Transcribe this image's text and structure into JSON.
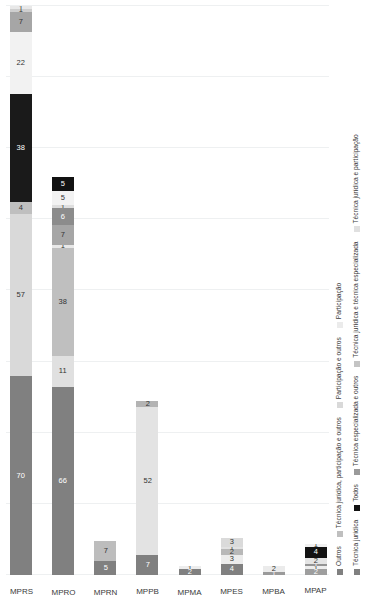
{
  "chart_data": {
    "type": "bar",
    "orientation": "stacked-horizontal",
    "title": "",
    "xlabel": "",
    "ylabel": "",
    "grid": true,
    "legend_position": "bottom",
    "xlim": [
      0,
      200
    ],
    "categories": [
      "MPRS",
      "MPRO",
      "MPRN",
      "MPPB",
      "MPMA",
      "MPES",
      "MPBA",
      "MPAP"
    ],
    "series": [
      {
        "name": "Técnica jurídica",
        "color": "#808080",
        "values": [
          70,
          66,
          5,
          7,
          2,
          4,
          1,
          2
        ]
      },
      {
        "name": "Todos",
        "color": "#121212",
        "values": [
          0,
          0,
          0,
          0,
          0,
          0,
          0,
          4
        ]
      },
      {
        "name": "Técnica especializada e outros",
        "color": "#d9d9d9",
        "values": [
          57,
          11,
          7,
          52,
          0,
          3,
          2,
          1
        ]
      },
      {
        "name": "Técnica jurídica e técnica especializada",
        "color": "#bfbfbf",
        "values": [
          4,
          38,
          0,
          0,
          1,
          2,
          0,
          2
        ]
      },
      {
        "name": "Técnica jurídica e participação",
        "color": "#e8e8e8",
        "values": [
          0,
          1,
          0,
          0,
          0,
          1,
          0,
          1
        ]
      },
      {
        "name": "Outros",
        "color": "#1a1a1a",
        "values": [
          38,
          7,
          0,
          0,
          0,
          0,
          0,
          0
        ]
      },
      {
        "name": "Técnica jurídica, participação e outros",
        "color": "#f2f2f2",
        "values": [
          22,
          6,
          0,
          2,
          1,
          3,
          0,
          1
        ]
      },
      {
        "name": "Participação e outros",
        "color": "#a6a6a6",
        "values": [
          7,
          1,
          0,
          0,
          0,
          0,
          0,
          0
        ]
      },
      {
        "name": "Participação",
        "color": "#cfcfcf",
        "values": [
          1,
          5,
          0,
          0,
          0,
          0,
          0,
          0
        ]
      }
    ],
    "stacks": [
      {
        "category": "MPRS",
        "segments": [
          {
            "series": "Técnica jurídica",
            "value": 70,
            "label": "70",
            "color": "#808080",
            "label_color": "#ffffff"
          },
          {
            "series": "Técnica especializada e outros",
            "value": 57,
            "label": "57",
            "color": "#d9d9d9",
            "label_color": "#333333"
          },
          {
            "series": "Técnica jurídica e técnica especializada",
            "value": 4,
            "label": "4",
            "color": "#bfbfbf",
            "label_color": "#333333"
          },
          {
            "series": "Outros",
            "value": 38,
            "label": "38",
            "color": "#1a1a1a",
            "label_color": "#ffffff"
          },
          {
            "series": "Técnica jurídica, participação e outros",
            "value": 22,
            "label": "22",
            "color": "#f2f2f2",
            "label_color": "#333333"
          },
          {
            "series": "Participação e outros",
            "value": 7,
            "label": "7",
            "color": "#a6a6a6",
            "label_color": "#333333"
          },
          {
            "series": "Participação",
            "value": 1,
            "label": "1",
            "color": "#cfcfcf",
            "label_color": "#333333"
          },
          {
            "series": "Técnica jurídica e participação",
            "value": 1,
            "label": "1",
            "color": "#e8e8e8",
            "label_color": "#333333"
          }
        ]
      },
      {
        "category": "MPRO",
        "segments": [
          {
            "series": "Técnica jurídica",
            "value": 66,
            "label": "66",
            "color": "#808080",
            "label_color": "#ffffff"
          },
          {
            "series": "Técnica especializada e outros",
            "value": 11,
            "label": "11",
            "color": "#e0e0e0",
            "label_color": "#333333"
          },
          {
            "series": "Técnica jurídica e técnica especializada",
            "value": 38,
            "label": "38",
            "color": "#bfbfbf",
            "label_color": "#333333"
          },
          {
            "series": "Técnica jurídica e participação",
            "value": 1,
            "label": "1",
            "color": "#e8e8e8",
            "label_color": "#333333"
          },
          {
            "series": "Participação e outros",
            "value": 7,
            "label": "7",
            "color": "#a6a6a6",
            "label_color": "#333333"
          },
          {
            "series": "Outros",
            "value": 6,
            "label": "6",
            "color": "#8c8c8c",
            "label_color": "#ffffff"
          },
          {
            "series": "Participação",
            "value": 1,
            "label": "1",
            "color": "#dedede",
            "label_color": "#333333"
          },
          {
            "series": "Técnica jurídica, participação e outros",
            "value": 5,
            "label": "5",
            "color": "#f2f2f2",
            "label_color": "#333333"
          },
          {
            "series": "Todos",
            "value": 5,
            "label": "5",
            "color": "#121212",
            "label_color": "#ffffff"
          }
        ]
      },
      {
        "category": "MPRN",
        "segments": [
          {
            "series": "Técnica jurídica",
            "value": 5,
            "label": "5",
            "color": "#808080",
            "label_color": "#ffffff"
          },
          {
            "series": "Técnica especializada e outros",
            "value": 7,
            "label": "7",
            "color": "#bdbdbd",
            "label_color": "#333333"
          }
        ]
      },
      {
        "category": "MPPB",
        "segments": [
          {
            "series": "Técnica jurídica",
            "value": 7,
            "label": "7",
            "color": "#808080",
            "label_color": "#ffffff"
          },
          {
            "series": "Técnica especializada e outros",
            "value": 52,
            "label": "52",
            "color": "#e3e3e3",
            "label_color": "#333333"
          },
          {
            "series": "Técnica jurídica, participação e outros",
            "value": 2,
            "label": "2",
            "color": "#b3b3b3",
            "label_color": "#333333"
          }
        ]
      },
      {
        "category": "MPMA",
        "segments": [
          {
            "series": "Técnica jurídica",
            "value": 2,
            "label": "2",
            "color": "#808080",
            "label_color": "#ffffff"
          },
          {
            "series": "Técnica jurídica, participação e outros",
            "value": 1,
            "label": "1",
            "color": "#ededed",
            "label_color": "#333333"
          }
        ]
      },
      {
        "category": "MPES",
        "segments": [
          {
            "series": "Técnica jurídica",
            "value": 4,
            "label": "4",
            "color": "#808080",
            "label_color": "#ffffff"
          },
          {
            "series": "Técnica jurídica, participação e outros",
            "value": 3,
            "label": "3",
            "color": "#ececec",
            "label_color": "#333333"
          },
          {
            "series": "Técnica jurídica e técnica especializada",
            "value": 2,
            "label": "2",
            "color": "#b8b8b8",
            "label_color": "#333333"
          },
          {
            "series": "Técnica jurídica e participação",
            "value": 1,
            "label": "1",
            "color": "#e2e2e2",
            "label_color": "#333333"
          },
          {
            "series": "Técnica especializada e outros",
            "value": 3,
            "label": "3",
            "color": "#dadada",
            "label_color": "#333333"
          }
        ]
      },
      {
        "category": "MPBA",
        "segments": [
          {
            "series": "Técnica jurídica",
            "value": 1,
            "label": "1",
            "color": "#9a9a9a",
            "label_color": "#ffffff"
          },
          {
            "series": "Técnica especializada e outros",
            "value": 2,
            "label": "2",
            "color": "#ebebeb",
            "label_color": "#333333"
          }
        ]
      },
      {
        "category": "MPAP",
        "segments": [
          {
            "series": "Técnica jurídica",
            "value": 2,
            "label": "2",
            "color": "#9e9e9e",
            "label_color": "#ffffff"
          },
          {
            "series": "Técnica jurídica e participação",
            "value": 1,
            "label": "1",
            "color": "#ededed",
            "label_color": "#333333"
          },
          {
            "series": "Técnica jurídica e técnica especializada",
            "value": 1,
            "label": "1",
            "color": "#949494",
            "label_color": "#ffffff"
          },
          {
            "series": "Técnica especializada e outros",
            "value": 2,
            "label": "2",
            "color": "#e4e4e4",
            "label_color": "#333333"
          },
          {
            "series": "Todos",
            "value": 4,
            "label": "4",
            "color": "#121212",
            "label_color": "#ffffff"
          },
          {
            "series": "Técnica jurídica, participação e outros",
            "value": 1,
            "label": "1",
            "color": "#f0f0f0",
            "label_color": "#333333"
          }
        ]
      }
    ],
    "legend": {
      "row_top": [
        {
          "label": "Outros",
          "color": "#808080"
        },
        {
          "label": "Técnica jurídica, participação e outros",
          "color": "#bfbfbf"
        },
        {
          "label": "Participação e outros",
          "color": "#d9d9d9"
        },
        {
          "label": "Participação",
          "color": "#ebebeb"
        }
      ],
      "row_bottom": [
        {
          "label": "Técnica jurídica",
          "color": "#808080"
        },
        {
          "label": "Todos",
          "color": "#121212"
        },
        {
          "label": "Técnica especializada e outros",
          "color": "#9a9a9a"
        },
        {
          "label": "Técnica jurídica e técnica especializada",
          "color": "#c4c4c4"
        },
        {
          "label": "Técnica jurídica e participação",
          "color": "#e0e0e0"
        }
      ]
    },
    "gridline_positions": [
      0,
      25,
      50,
      75,
      100,
      125,
      150,
      175,
      200
    ]
  }
}
